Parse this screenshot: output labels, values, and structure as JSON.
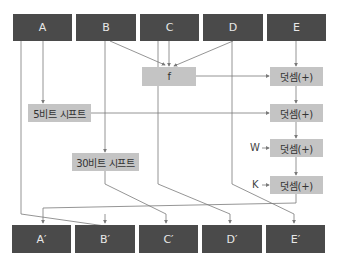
{
  "colors": {
    "register_fill": "#4a4a4a",
    "register_text": "#e8e8e8",
    "op_fill": "#c4c4c4",
    "op_text": "#333333",
    "wire": "#7a7a7a"
  },
  "inputs": [
    {
      "label": "A"
    },
    {
      "label": "B"
    },
    {
      "label": "C"
    },
    {
      "label": "D"
    },
    {
      "label": "E"
    }
  ],
  "outputs": [
    {
      "label": "A′"
    },
    {
      "label": "B′"
    },
    {
      "label": "C′"
    },
    {
      "label": "D′"
    },
    {
      "label": "E′"
    }
  ],
  "operations": {
    "f": "f",
    "shift5": "5비트 시프트",
    "shift30": "30비트 시프트",
    "adders": [
      "덧셈(+)",
      "덧셈(+)",
      "덧셈(+)",
      "덧셈(+)"
    ]
  },
  "side_inputs": {
    "w": "W",
    "k": "K"
  }
}
